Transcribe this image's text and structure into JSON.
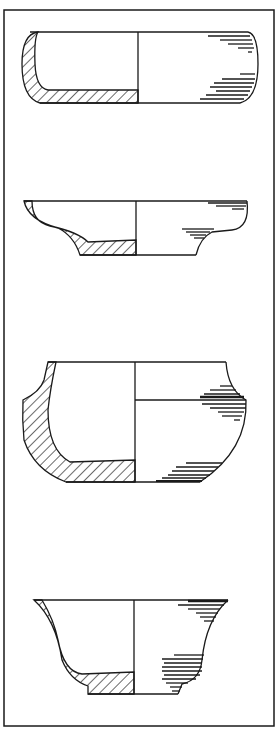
{
  "figure": {
    "type": "pottery profile drawings",
    "vessel_count": 4,
    "vessels": [
      {
        "id": 1,
        "form": "shallow dish with rounded walls"
      },
      {
        "id": 2,
        "form": "shallow bowl with flaring everted rim"
      },
      {
        "id": 3,
        "form": "carinated bowl with concave neck"
      },
      {
        "id": 4,
        "form": "flaring bowl with ring foot"
      }
    ],
    "colors": {
      "ink": "#1a1a1a",
      "paper": "#ffffff"
    }
  }
}
